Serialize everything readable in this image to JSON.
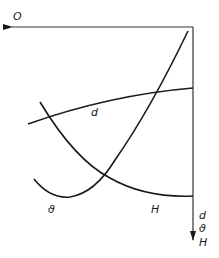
{
  "diagram": {
    "type": "characteristic-curves",
    "colors": {
      "line": "#1a1a1a",
      "axis": "#333333",
      "background": "#ffffff"
    },
    "axes": {
      "horizontal": {
        "label": "O",
        "direction": "left"
      },
      "vertical": {
        "labels": [
          "d",
          "ϑ",
          "H"
        ],
        "direction": "down"
      }
    },
    "curves": [
      {
        "id": "d",
        "label": "d",
        "shape": "gently rising, slightly concave"
      },
      {
        "id": "H",
        "label": "H",
        "shape": "decreasing, concave up, flattening toward right"
      },
      {
        "id": "theta",
        "label": "ϑ",
        "shape": "U-shaped minimum at left, rising steeply to upper right"
      }
    ]
  }
}
